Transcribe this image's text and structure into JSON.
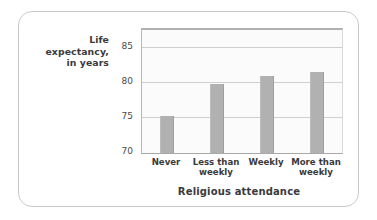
{
  "chart_data": {
    "type": "bar",
    "title": "",
    "categories": [
      "Never",
      "Less than weekly",
      "Weekly",
      "More than weekly"
    ],
    "category_lines": [
      [
        "Never"
      ],
      [
        "Less than",
        "weekly"
      ],
      [
        "Weekly"
      ],
      [
        "More than",
        "weekly"
      ]
    ],
    "values": [
      75.2,
      79.8,
      81.0,
      81.5
    ],
    "xlabel": "Religious attendance",
    "ylabel": "Life expectancy, in years",
    "ylabel_lines": [
      "Life",
      "expectancy,",
      "in years"
    ],
    "ylim": [
      70,
      87.5
    ],
    "yticks": [
      70,
      75,
      80,
      85
    ],
    "ytick_labels": [
      "70",
      "75",
      "80",
      "85"
    ],
    "grid": true,
    "legend": "none",
    "bar_color": "#b1b1b1",
    "gridline_color": "#cfcfcf",
    "plot_background": "#fbfbfb",
    "frame_border_color": "#c9c9c9",
    "text_color": "#3a3a3a"
  }
}
